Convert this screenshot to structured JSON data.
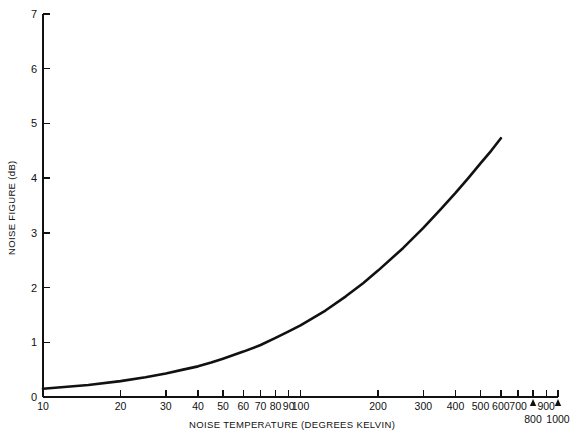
{
  "chart_data": {
    "type": "line",
    "title": "",
    "xlabel": "NOISE TEMPERATURE (DEGREES KELVIN)",
    "ylabel": "NOISE FIGURE (dB)",
    "xscale": "log",
    "yscale": "linear",
    "xlim": [
      10,
      1000
    ],
    "ylim": [
      0,
      7
    ],
    "grid": false,
    "legend": null,
    "x_tick_labels": [
      "10",
      "20",
      "30",
      "40",
      "50",
      "60",
      "70",
      "80",
      "90",
      "100",
      "200",
      "300",
      "400",
      "500",
      "600",
      "700",
      "800",
      "900",
      "1000"
    ],
    "x_tick_values": [
      10,
      20,
      30,
      40,
      50,
      60,
      70,
      80,
      90,
      100,
      200,
      300,
      400,
      500,
      600,
      700,
      800,
      900,
      1000
    ],
    "x_labels_offset_row": [
      "800",
      "1000"
    ],
    "y_tick_labels": [
      "0",
      "1",
      "2",
      "3",
      "4",
      "5",
      "6",
      "7"
    ],
    "y_tick_values": [
      0,
      1,
      2,
      3,
      4,
      5,
      6,
      7
    ],
    "series": [
      {
        "name": "Noise Figure vs Noise Temperature",
        "relation": "NF = 10 log10(1 + T/290)",
        "x": [
          10,
          15,
          20,
          25,
          30,
          35,
          40,
          45,
          50,
          60,
          70,
          80,
          90,
          100,
          125,
          150,
          175,
          200,
          250,
          300,
          350,
          400,
          450,
          500,
          550,
          600
        ],
        "y": [
          0.15,
          0.22,
          0.29,
          0.36,
          0.43,
          0.5,
          0.56,
          0.63,
          0.7,
          0.83,
          0.95,
          1.08,
          1.2,
          1.31,
          1.58,
          1.84,
          2.08,
          2.31,
          2.72,
          3.09,
          3.43,
          3.73,
          4.01,
          4.27,
          4.5,
          4.73
        ],
        "color": "#111111",
        "linewidth": 2.6
      }
    ]
  },
  "axes": {
    "y_axis_title": "NOISE FIGURE (dB)",
    "x_axis_title": "NOISE TEMPERATURE (DEGREES KELVIN)"
  },
  "markers": {
    "caret_labels": [
      "800",
      "1000"
    ]
  },
  "colors": {
    "background": "#ffffff",
    "foreground": "#111111",
    "curve": "#111111"
  },
  "faint_caption": ""
}
